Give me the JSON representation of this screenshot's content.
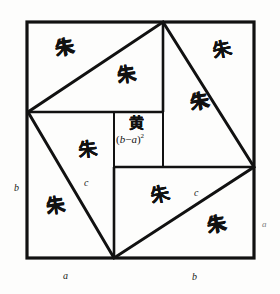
{
  "figure": {
    "colors": {
      "stroke": "#111111",
      "background": "#fdfdfc",
      "label_text": "#1a1a1a",
      "faint_label_text": "#7d7d7d"
    },
    "stroke_widths": {
      "outer_square": 3.2,
      "tilted_square": 3.0,
      "inner_lines": 2.6,
      "center_square": 2.0
    }
  },
  "geometry": {
    "outer_square": {
      "left": 27,
      "top": 22,
      "right": 254,
      "bottom": 258
    },
    "tilted_square_vertices": {
      "top": [
        163,
        22
      ],
      "right": [
        254,
        167
      ],
      "bottom": [
        114,
        258
      ],
      "left": [
        28,
        112
      ]
    },
    "center_square": {
      "left": 114,
      "top": 112,
      "right": 163,
      "bottom": 167
    }
  },
  "region_labels": {
    "red_char": "朱",
    "yellow_char": "黄",
    "red_regions": [
      {
        "id": "top-left-outer",
        "char": "朱",
        "x": 55,
        "y": 38
      },
      {
        "id": "top-center-inner",
        "char": "朱",
        "x": 117,
        "y": 65
      },
      {
        "id": "top-right-outer",
        "char": "朱",
        "x": 212,
        "y": 40
      },
      {
        "id": "right-inner",
        "char": "朱",
        "x": 190,
        "y": 92
      },
      {
        "id": "left-inner",
        "char": "朱",
        "x": 78,
        "y": 140
      },
      {
        "id": "bottom-left-outer",
        "char": "朱",
        "x": 46,
        "y": 196
      },
      {
        "id": "bottom-center-inner",
        "char": "朱",
        "x": 150,
        "y": 185
      },
      {
        "id": "bottom-right-outer",
        "char": "朱",
        "x": 207,
        "y": 215
      }
    ],
    "yellow_region": {
      "id": "center-square",
      "char": "黄",
      "x": 129,
      "y": 118
    }
  },
  "formula": {
    "center_expression_open": "(",
    "center_expression_b": "b",
    "center_expression_minus": "−",
    "center_expression_a": "a",
    "center_expression_close": ")",
    "center_expression_exponent": "2",
    "center_expression_full": "(b−a)²",
    "x": 116,
    "y": 133
  },
  "dimension_labels": [
    {
      "id": "left-side-b",
      "text": "b",
      "x": 14,
      "y": 183,
      "style": "normal"
    },
    {
      "id": "left-diagonal-c",
      "text": "c",
      "x": 84,
      "y": 178,
      "style": "normal"
    },
    {
      "id": "right-diagonal-c",
      "text": "c",
      "x": 194,
      "y": 188,
      "style": "normal"
    },
    {
      "id": "right-side-a",
      "text": "a",
      "x": 262,
      "y": 220,
      "style": "faint"
    },
    {
      "id": "bottom-left-a",
      "text": "a",
      "x": 63,
      "y": 271,
      "style": "normal"
    },
    {
      "id": "bottom-right-b",
      "text": "b",
      "x": 192,
      "y": 272,
      "style": "normal"
    }
  ]
}
